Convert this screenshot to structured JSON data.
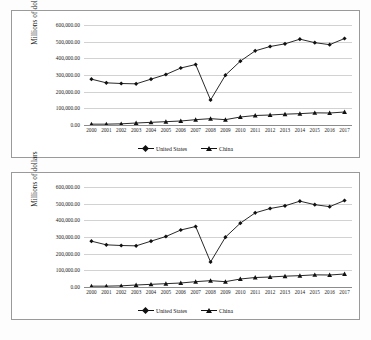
{
  "page": {
    "background_color": "#fdfdfd",
    "border_color": "#9a9a9a"
  },
  "legend": {
    "series_1_label": "United States",
    "series_2_label": "China",
    "marker_1": "diamond-marker",
    "marker_2": "triangle-marker",
    "position": "bottom-center"
  },
  "axis": {
    "y_title": "Millions of dollars",
    "y_ticks": [
      "600,000.00",
      "500,000.00",
      "400,000.00",
      "300,000.00",
      "200,000.00",
      "100,000.00",
      "0.00"
    ],
    "x_ticks": [
      "2000",
      "2001",
      "2002",
      "2003",
      "2004",
      "2005",
      "2006",
      "2007",
      "2008",
      "2009",
      "2010",
      "2011",
      "2012",
      "2013",
      "2014",
      "2015",
      "2016",
      "2017"
    ]
  },
  "charts": [
    {
      "id": "chart-top",
      "name": "chart-united-states-china-top"
    },
    {
      "id": "chart-bottom",
      "name": "chart-united-states-china-bottom"
    }
  ],
  "chart_data": [
    {
      "type": "line",
      "title": "",
      "xlabel": "",
      "ylabel": "Millions of dollars",
      "ylim": [
        0,
        600000
      ],
      "grid": true,
      "legend_position": "bottom-center",
      "categories": [
        "2000",
        "2001",
        "2002",
        "2003",
        "2004",
        "2005",
        "2006",
        "2007",
        "2008",
        "2009",
        "2010",
        "2011",
        "2012",
        "2013",
        "2014",
        "2015",
        "2016",
        "2017"
      ],
      "series": [
        {
          "name": "United States",
          "marker": "diamond",
          "values": [
            275000,
            253000,
            249000,
            247000,
            275000,
            303000,
            342000,
            363000,
            150000,
            299000,
            383000,
            445000,
            471000,
            487000,
            515000,
            494000,
            482000,
            519000
          ]
        },
        {
          "name": "China",
          "marker": "triangle",
          "values": [
            5000,
            5000,
            7000,
            12000,
            16000,
            20000,
            24000,
            32000,
            38000,
            32000,
            48000,
            57000,
            60000,
            65000,
            68000,
            73000,
            72000,
            78000
          ]
        }
      ]
    },
    {
      "type": "line",
      "title": "",
      "xlabel": "",
      "ylabel": "Millions of dollars",
      "ylim": [
        0,
        600000
      ],
      "grid": true,
      "legend_position": "bottom-center",
      "categories": [
        "2000",
        "2001",
        "2002",
        "2003",
        "2004",
        "2005",
        "2006",
        "2007",
        "2008",
        "2009",
        "2010",
        "2011",
        "2012",
        "2013",
        "2014",
        "2015",
        "2016",
        "2017"
      ],
      "series": [
        {
          "name": "United States",
          "marker": "diamond",
          "values": [
            275000,
            253000,
            249000,
            247000,
            275000,
            303000,
            342000,
            363000,
            150000,
            299000,
            383000,
            445000,
            471000,
            487000,
            515000,
            494000,
            482000,
            519000
          ]
        },
        {
          "name": "China",
          "marker": "triangle",
          "values": [
            5000,
            5000,
            7000,
            12000,
            16000,
            20000,
            24000,
            32000,
            38000,
            32000,
            48000,
            57000,
            60000,
            65000,
            68000,
            73000,
            72000,
            78000
          ]
        }
      ]
    }
  ]
}
